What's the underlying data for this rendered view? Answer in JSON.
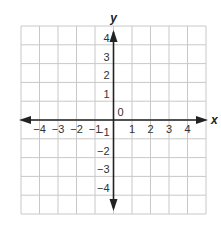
{
  "diagram": {
    "type": "coordinate-plane",
    "grid": {
      "cols": 10,
      "rows": 10,
      "left": 21,
      "top": 26,
      "right": 206,
      "bottom": 214,
      "color": "#c8c8c8"
    },
    "axes": {
      "color": "#222222",
      "x_label": "x",
      "y_label": "y",
      "origin_label": "0",
      "x_range": [
        -5,
        5
      ],
      "y_range": [
        -5,
        5
      ]
    },
    "x_ticks": [
      {
        "value": -4,
        "label": "−4"
      },
      {
        "value": -3,
        "label": "−3"
      },
      {
        "value": -2,
        "label": "−2"
      },
      {
        "value": -1,
        "label": "−1"
      },
      {
        "value": 1,
        "label": "1"
      },
      {
        "value": 2,
        "label": "2"
      },
      {
        "value": 3,
        "label": "3"
      },
      {
        "value": 4,
        "label": "4"
      }
    ],
    "y_ticks": [
      {
        "value": 4,
        "label": "4"
      },
      {
        "value": 3,
        "label": "3"
      },
      {
        "value": 2,
        "label": "2"
      },
      {
        "value": 1,
        "label": "1"
      },
      {
        "value": -1,
        "label": "−1"
      },
      {
        "value": -2,
        "label": "−2"
      },
      {
        "value": -3,
        "label": "−3"
      },
      {
        "value": -4,
        "label": "−4"
      }
    ]
  }
}
